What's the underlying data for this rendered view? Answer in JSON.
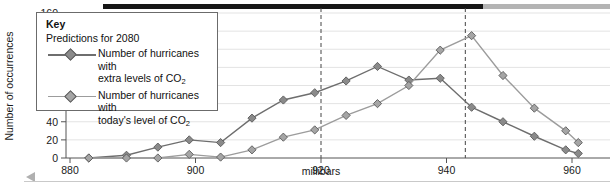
{
  "chart_data": {
    "type": "line",
    "title": "",
    "xlabel": "millibars",
    "ylabel": "Number of occurrences",
    "xlim": [
      878,
      962
    ],
    "ylim": [
      0,
      160
    ],
    "xticks": [
      880,
      900,
      920,
      940,
      960
    ],
    "yticks": [
      0,
      20,
      40,
      60,
      80,
      100,
      120,
      140,
      160
    ],
    "grid": "horizontal",
    "legend_position": "top-left",
    "legend_title": "Key",
    "legend_subtitle": "Predictions for 2080",
    "annotations": [
      {
        "type": "vline",
        "x": 920,
        "style": "dashed"
      },
      {
        "type": "vline",
        "x": 943,
        "style": "dashed"
      },
      {
        "type": "range-bar",
        "from": 883,
        "to": 943,
        "color": "#161616"
      },
      {
        "type": "range-bar",
        "from": 943,
        "to": 962,
        "color": "#b4b4b4"
      }
    ],
    "series": [
      {
        "name": "Number of hurricanes with extra levels of CO2",
        "name_line1": "Number of hurricanes with",
        "name_line2_pre": "extra levels of CO",
        "name_line2_sub": "2",
        "color": "#6e6e6e",
        "marker_fill": "#8a8a8a",
        "x": [
          883,
          889,
          894,
          899,
          904,
          909,
          914,
          919,
          924,
          929,
          934,
          939,
          944,
          949,
          954,
          959,
          961
        ],
        "y": [
          0,
          3,
          12,
          20,
          17,
          44,
          64,
          72,
          85,
          101,
          86,
          88,
          56,
          40,
          24,
          9,
          5
        ]
      },
      {
        "name": "Number of hurricanes with today's level of CO2",
        "name_line1": "Number of hurricanes with",
        "name_line2_pre": "today's level of CO",
        "name_line2_sub": "2",
        "color": "#9c9c9c",
        "marker_fill": "#a5a5a5",
        "x": [
          883,
          889,
          894,
          899,
          904,
          909,
          914,
          919,
          924,
          929,
          934,
          939,
          944,
          949,
          954,
          959,
          961
        ],
        "y": [
          0,
          0,
          0,
          4,
          1,
          9,
          23,
          31,
          47,
          60,
          80,
          119,
          135,
          91,
          55,
          30,
          17
        ]
      }
    ]
  },
  "axes": {
    "y_title": "Number of occurrences",
    "x_title": "millibars"
  }
}
